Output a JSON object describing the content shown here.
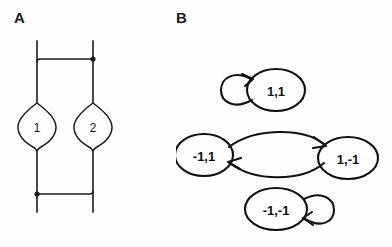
{
  "figure": {
    "panels": [
      {
        "id": "A",
        "label": "A",
        "type": "circuit-diagram",
        "description": "Two Josephson junctions in parallel forming a loop",
        "elements": [
          {
            "name": "junction-1",
            "label": "1"
          },
          {
            "name": "junction-2",
            "label": "2"
          }
        ],
        "nodes": [
          {
            "name": "top-node-dot"
          },
          {
            "name": "bottom-node-dot"
          }
        ]
      },
      {
        "id": "B",
        "label": "B",
        "type": "state-transition-diagram",
        "states": [
          {
            "name": "state-1-1",
            "label": "1,1"
          },
          {
            "name": "state-neg1-1",
            "label": "-1,1"
          },
          {
            "name": "state-1-neg1",
            "label": "1,-1"
          },
          {
            "name": "state-neg1-neg1",
            "label": "-1,-1"
          }
        ],
        "transitions": [
          {
            "name": "self-loop-1-1",
            "from": "1,1",
            "to": "1,1"
          },
          {
            "name": "edge-neg1-1-to-1-neg1",
            "from": "-1,1",
            "to": "1,-1"
          },
          {
            "name": "edge-1-neg1-to-neg1-1",
            "from": "1,-1",
            "to": "-1,1"
          },
          {
            "name": "self-loop-neg1-neg1",
            "from": "-1,-1",
            "to": "-1,-1"
          }
        ]
      }
    ],
    "colors": {
      "ink": "#1b1b1b",
      "stroke": "#111111",
      "background": "#fefefe"
    }
  }
}
